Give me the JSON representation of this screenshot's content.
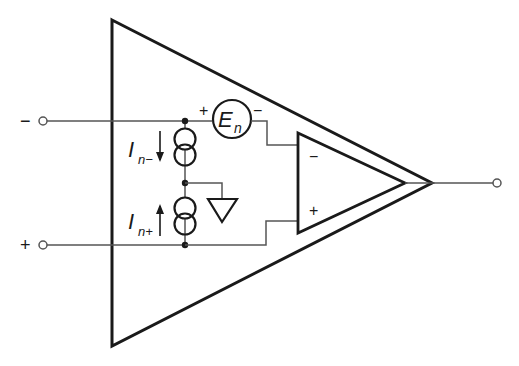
{
  "diagram": {
    "inputs": {
      "inverting": {
        "sign": "−"
      },
      "noninverting": {
        "sign": "+"
      }
    },
    "voltage_noise": {
      "symbol": "E",
      "subscript": "n",
      "plus": "+",
      "minus": "−"
    },
    "current_noise_minus": {
      "symbol": "I",
      "subscript": "n−"
    },
    "current_noise_plus": {
      "symbol": "I",
      "subscript": "n+"
    },
    "inner_opamp": {
      "minus": "−",
      "plus": "+"
    },
    "colors": {
      "stroke": "#1a1a1a",
      "wire": "#555555",
      "background": "#ffffff"
    }
  }
}
